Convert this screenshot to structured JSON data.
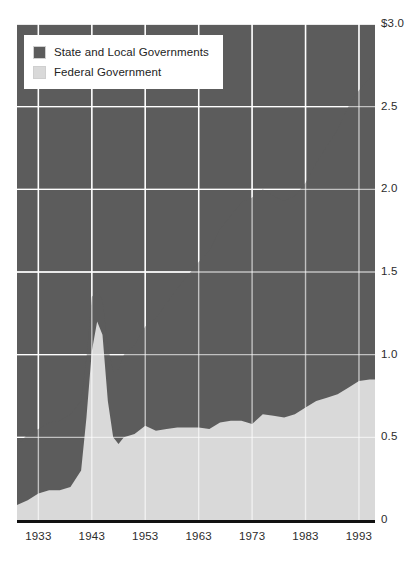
{
  "top_caption": "",
  "legend": {
    "position": "top-left-inside",
    "items": [
      {
        "label": "State and Local Governments",
        "color": "#5c5c5c",
        "swatch_icon": "legend-swatch-icon"
      },
      {
        "label": "Federal Government",
        "color": "#d9d9d9",
        "swatch_icon": "legend-swatch-icon"
      }
    ]
  },
  "chart_data": {
    "type": "area",
    "stacked": true,
    "title": "",
    "subtitle": "",
    "xlabel": "",
    "ylabel": "",
    "xlim": [
      1929,
      1996
    ],
    "ylim": [
      0,
      3.0
    ],
    "grid": true,
    "grid_color": "#ffffff",
    "plot_background": "#5c5c5c",
    "y_ticks": [
      0,
      0.5,
      1.0,
      1.5,
      2.0,
      2.5,
      3.0
    ],
    "y_tick_labels": [
      "0",
      "0.5",
      "1.0",
      "1.5",
      "2.0",
      "2.5",
      "$3.0"
    ],
    "x_ticks": [
      1933,
      1943,
      1953,
      1963,
      1973,
      1983,
      1993
    ],
    "x_tick_labels": [
      "1933",
      "1943",
      "1953",
      "1963",
      "1973",
      "1983",
      "1993"
    ],
    "x": [
      1929,
      1931,
      1933,
      1935,
      1937,
      1939,
      1941,
      1942,
      1943,
      1944,
      1945,
      1946,
      1947,
      1948,
      1949,
      1951,
      1953,
      1955,
      1957,
      1959,
      1961,
      1963,
      1965,
      1967,
      1969,
      1971,
      1973,
      1975,
      1977,
      1979,
      1981,
      1983,
      1985,
      1987,
      1989,
      1991,
      1993,
      1995,
      1996
    ],
    "series": [
      {
        "name": "Federal Government",
        "color": "#d9d9d9",
        "stack_order": 1,
        "values": [
          0.09,
          0.12,
          0.16,
          0.18,
          0.18,
          0.2,
          0.3,
          0.62,
          1.02,
          1.2,
          1.12,
          0.72,
          0.5,
          0.46,
          0.5,
          0.52,
          0.57,
          0.54,
          0.55,
          0.56,
          0.56,
          0.56,
          0.55,
          0.59,
          0.6,
          0.6,
          0.58,
          0.64,
          0.63,
          0.62,
          0.64,
          0.68,
          0.72,
          0.74,
          0.76,
          0.8,
          0.84,
          0.85,
          0.85
        ]
      },
      {
        "name": "State and Local Governments",
        "color": "#5c5c5c",
        "stack_order": 2,
        "values": [
          0.36,
          0.4,
          0.39,
          0.41,
          0.42,
          0.44,
          0.42,
          0.36,
          0.33,
          0.18,
          0.21,
          0.33,
          0.4,
          0.45,
          0.5,
          0.54,
          0.6,
          0.68,
          0.76,
          0.84,
          0.92,
          1.0,
          1.08,
          1.17,
          1.24,
          1.32,
          1.37,
          1.36,
          1.33,
          1.31,
          1.32,
          1.36,
          1.44,
          1.52,
          1.6,
          1.7,
          1.76,
          1.82,
          1.85
        ]
      }
    ],
    "totals": [
      0.45,
      0.52,
      0.55,
      0.59,
      0.6,
      0.64,
      0.72,
      0.98,
      1.35,
      1.38,
      1.33,
      1.05,
      0.9,
      0.91,
      1.0,
      1.06,
      1.17,
      1.22,
      1.31,
      1.4,
      1.48,
      1.56,
      1.63,
      1.76,
      1.84,
      1.92,
      1.95,
      2.0,
      1.96,
      1.93,
      1.96,
      2.04,
      2.16,
      2.26,
      2.36,
      2.5,
      2.6,
      2.67,
      2.7
    ]
  }
}
